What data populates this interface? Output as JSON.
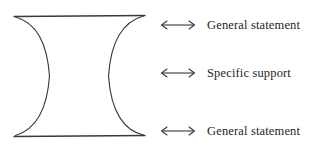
{
  "figure": {
    "name": "hourglass-essay-structure-diagram",
    "background_color": "#ffffff",
    "stroke_color": "#3a3a3a",
    "text_color": "#231f20",
    "shape": {
      "type": "hourglass",
      "description": "Concave-sided hourglass: horizontal cap lines at top and bottom, curved sides pinching to a narrow waist at mid-height",
      "top_cap_y": 16,
      "bottom_cap_y": 136,
      "cap_left_x": 14,
      "cap_right_x": 145,
      "waist_left_x": 50,
      "waist_right_x": 108,
      "waist_y": 76
    },
    "rows": [
      {
        "id": "top",
        "arrow": "double-headed-horizontal-arrow",
        "arrow_glyph": "↔",
        "label": "General statement"
      },
      {
        "id": "middle",
        "arrow": "double-headed-horizontal-arrow",
        "arrow_glyph": "↔",
        "label": "Specific support"
      },
      {
        "id": "bottom",
        "arrow": "double-headed-horizontal-arrow",
        "arrow_glyph": "↔",
        "label": "General statement"
      }
    ]
  }
}
